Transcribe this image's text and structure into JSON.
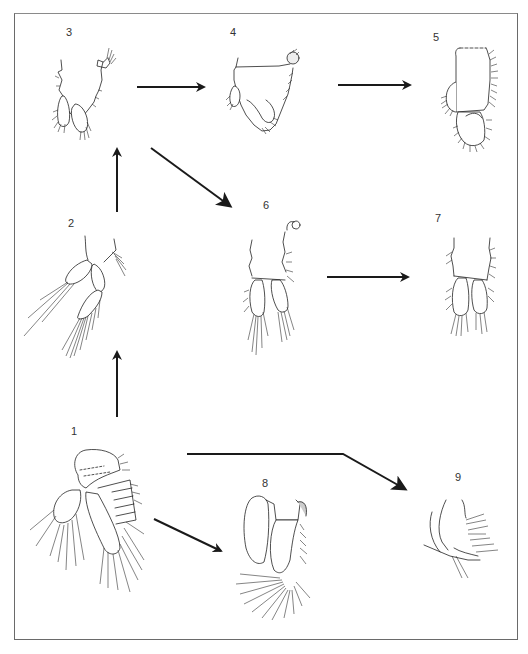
{
  "figure": {
    "type": "scientific-illustration",
    "colors": {
      "ink": "#222222",
      "background": "#ffffff",
      "frame": "#6a6a6a"
    }
  },
  "panels": [
    {
      "id": "1",
      "label": "1",
      "label_pos": [
        73,
        432
      ]
    },
    {
      "id": "2",
      "label": "2",
      "label_pos": [
        71,
        224
      ]
    },
    {
      "id": "3",
      "label": "3",
      "label_pos": [
        68,
        33
      ]
    },
    {
      "id": "4",
      "label": "4",
      "label_pos": [
        233,
        33
      ]
    },
    {
      "id": "5",
      "label": "5",
      "label_pos": [
        436,
        38
      ]
    },
    {
      "id": "6",
      "label": "6",
      "label_pos": [
        266,
        206
      ]
    },
    {
      "id": "7",
      "label": "7",
      "label_pos": [
        438,
        219
      ]
    },
    {
      "id": "8",
      "label": "8",
      "label_pos": [
        265,
        484
      ]
    },
    {
      "id": "9",
      "label": "9",
      "label_pos": [
        458,
        478
      ]
    }
  ],
  "arrows": [
    {
      "from": "1",
      "to": "2",
      "points": [
        [
          117,
          417
        ],
        [
          117,
          350
        ]
      ]
    },
    {
      "from": "2",
      "to": "3",
      "points": [
        [
          117,
          212
        ],
        [
          117,
          147
        ]
      ]
    },
    {
      "from": "3",
      "to": "4",
      "points": [
        [
          137,
          87
        ],
        [
          206,
          87
        ]
      ]
    },
    {
      "from": "4",
      "to": "5",
      "points": [
        [
          338,
          85
        ],
        [
          412,
          85
        ]
      ]
    },
    {
      "from": "3",
      "to": "6",
      "points": [
        [
          151,
          148
        ],
        [
          232,
          207
        ]
      ]
    },
    {
      "from": "6",
      "to": "7",
      "points": [
        [
          327,
          277
        ],
        [
          410,
          277
        ]
      ]
    },
    {
      "from": "1",
      "to": "8",
      "points": [
        [
          154,
          519
        ],
        [
          223,
          552
        ]
      ]
    },
    {
      "from": "1",
      "to": "9",
      "points": [
        [
          187,
          454
        ],
        [
          343,
          454
        ],
        [
          407,
          490
        ]
      ]
    }
  ]
}
